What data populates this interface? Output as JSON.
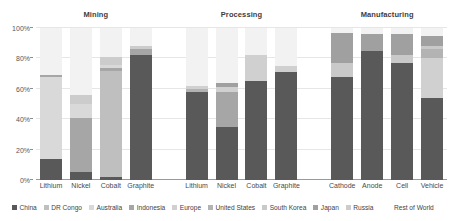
{
  "panels": [
    {
      "title": "Mining"
    },
    {
      "title": "Processing"
    },
    {
      "title": "Manufacturing"
    }
  ],
  "legend": {
    "items": [
      {
        "label": "China",
        "color": "#595959"
      },
      {
        "label": "DR Congo",
        "color": "#bfbfbf"
      },
      {
        "label": "Australia",
        "color": "#d9d9d9"
      },
      {
        "label": "Indonesia",
        "color": "#a6a6a6"
      },
      {
        "label": "Europe",
        "color": "#d0d0d0"
      },
      {
        "label": "United States",
        "color": "#b3b3b3"
      },
      {
        "label": "South Korea",
        "color": "#c9c9c9"
      },
      {
        "label": "Japan",
        "color": "#a0a0a0"
      },
      {
        "label": "Russia",
        "color": "#cccccc"
      },
      {
        "label": "Rest of World",
        "color": "#f2f2f2"
      }
    ]
  },
  "yaxis": {
    "ticks": [
      "0%",
      "20%",
      "40%",
      "60%",
      "80%",
      "100%"
    ],
    "values": [
      0,
      20,
      40,
      60,
      80,
      100
    ],
    "min": 0,
    "max": 100
  },
  "chart_data": {
    "type": "bar",
    "stacked": true,
    "normalized": true,
    "title": "",
    "xlabel": "",
    "ylabel": "",
    "ylim": [
      0,
      100
    ],
    "grid": true,
    "legend_position": "bottom",
    "panels": [
      "Mining",
      "Processing",
      "Manufacturing"
    ],
    "series_names": [
      "China",
      "DR Congo",
      "Australia",
      "Indonesia",
      "Europe",
      "United States",
      "South Korea",
      "Japan",
      "Russia",
      "Rest of World"
    ],
    "groups": [
      {
        "panel": "Mining",
        "categories": [
          "Lithium",
          "Nickel",
          "Cobalt",
          "Graphite"
        ],
        "bars": [
          {
            "category": "Lithium",
            "segments": [
              {
                "name": "China",
                "value": 14
              },
              {
                "name": "Australia",
                "value": 54
              },
              {
                "name": "Indonesia",
                "value": 1
              },
              {
                "name": "Rest of World",
                "value": 31
              }
            ]
          },
          {
            "category": "Nickel",
            "segments": [
              {
                "name": "China",
                "value": 5
              },
              {
                "name": "Indonesia",
                "value": 36
              },
              {
                "name": "Australia",
                "value": 9
              },
              {
                "name": "Russia",
                "value": 6
              },
              {
                "name": "Rest of World",
                "value": 44
              }
            ]
          },
          {
            "category": "Cobalt",
            "segments": [
              {
                "name": "China",
                "value": 2
              },
              {
                "name": "DR Congo",
                "value": 70
              },
              {
                "name": "Indonesia",
                "value": 2
              },
              {
                "name": "Australia",
                "value": 2
              },
              {
                "name": "Russia",
                "value": 5
              },
              {
                "name": "Rest of World",
                "value": 19
              }
            ]
          },
          {
            "category": "Graphite",
            "segments": [
              {
                "name": "China",
                "value": 82
              },
              {
                "name": "Indonesia",
                "value": 4
              },
              {
                "name": "Russia",
                "value": 2
              },
              {
                "name": "Rest of World",
                "value": 12
              }
            ]
          }
        ]
      },
      {
        "panel": "Processing",
        "categories": [
          "Lithium",
          "Nickel",
          "Cobalt",
          "Graphite"
        ],
        "bars": [
          {
            "category": "Lithium",
            "segments": [
              {
                "name": "China",
                "value": 58
              },
              {
                "name": "United States",
                "value": 2
              },
              {
                "name": "Europe",
                "value": 2
              },
              {
                "name": "Rest of World",
                "value": 38
              }
            ]
          },
          {
            "category": "Nickel",
            "segments": [
              {
                "name": "China",
                "value": 35
              },
              {
                "name": "Indonesia",
                "value": 23
              },
              {
                "name": "Europe",
                "value": 3
              },
              {
                "name": "Japan",
                "value": 3
              },
              {
                "name": "Rest of World",
                "value": 36
              }
            ]
          },
          {
            "category": "Cobalt",
            "segments": [
              {
                "name": "China",
                "value": 65
              },
              {
                "name": "Europe",
                "value": 17
              },
              {
                "name": "Rest of World",
                "value": 18
              }
            ]
          },
          {
            "category": "Graphite",
            "segments": [
              {
                "name": "China",
                "value": 71
              },
              {
                "name": "Europe",
                "value": 4
              },
              {
                "name": "Rest of World",
                "value": 25
              }
            ]
          }
        ]
      },
      {
        "panel": "Manufacturing",
        "categories": [
          "Cathode",
          "Anode",
          "Cell",
          "Vehicle"
        ],
        "bars": [
          {
            "category": "Cathode",
            "segments": [
              {
                "name": "China",
                "value": 68
              },
              {
                "name": "South Korea",
                "value": 9
              },
              {
                "name": "Japan",
                "value": 20
              },
              {
                "name": "Rest of World",
                "value": 3
              }
            ]
          },
          {
            "category": "Anode",
            "segments": [
              {
                "name": "China",
                "value": 85
              },
              {
                "name": "Japan",
                "value": 11
              },
              {
                "name": "Rest of World",
                "value": 4
              }
            ]
          },
          {
            "category": "Cell",
            "segments": [
              {
                "name": "China",
                "value": 77
              },
              {
                "name": "South Korea",
                "value": 5
              },
              {
                "name": "Japan",
                "value": 14
              },
              {
                "name": "Rest of World",
                "value": 4
              }
            ]
          },
          {
            "category": "Vehicle",
            "segments": [
              {
                "name": "China",
                "value": 54
              },
              {
                "name": "Europe",
                "value": 26
              },
              {
                "name": "United States",
                "value": 6
              },
              {
                "name": "South Korea",
                "value": 2
              },
              {
                "name": "Japan",
                "value": 7
              },
              {
                "name": "Rest of World",
                "value": 5
              }
            ]
          }
        ]
      }
    ]
  }
}
